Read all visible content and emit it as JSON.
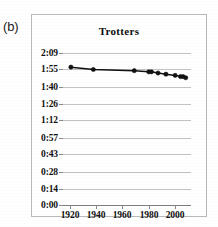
{
  "panel": {
    "label": "(b)"
  },
  "chart_data": {
    "type": "line",
    "title": "Trotters",
    "xlabel": "",
    "ylabel": "",
    "grid": "horizontal",
    "legend": "none",
    "xlim": [
      1915,
      2012
    ],
    "ylim_seconds": [
      0,
      129
    ],
    "xticks": [
      "1920",
      "1940",
      "1960",
      "1980",
      "2000"
    ],
    "xtick_values": [
      1920,
      1940,
      1960,
      1980,
      2000
    ],
    "yticks": [
      "0:00",
      "0:14",
      "0:28",
      "0:43",
      "0:57",
      "1:12",
      "1:26",
      "1:40",
      "1:55",
      "2:09"
    ],
    "ytick_seconds": [
      0,
      14,
      28,
      43,
      57,
      72,
      86,
      100,
      115,
      129
    ],
    "series": [
      {
        "name": "Trotters",
        "marker": "filled-circle",
        "color": "#111111",
        "x": [
          1921,
          1938,
          1969,
          1980,
          1982,
          1987,
          1993,
          2000,
          2004,
          2006,
          2008
        ],
        "y_labels": [
          "1:57",
          "1:55",
          "1:54",
          "1:53",
          "1:53",
          "1:52",
          "1:51",
          "1:50",
          "1:49",
          "1:49",
          "1:48"
        ],
        "y_seconds": [
          117,
          115,
          114,
          113,
          113,
          112,
          111,
          110,
          109,
          109,
          108
        ]
      }
    ]
  }
}
